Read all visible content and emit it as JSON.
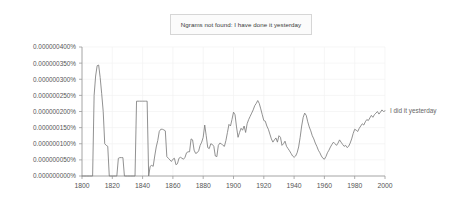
{
  "notice": {
    "text": "Ngrams not found: I have done it yesterday"
  },
  "chart_data": {
    "type": "line",
    "title": "",
    "xlabel": "",
    "ylabel": "",
    "xlim": [
      1800,
      2000
    ],
    "ylim": [
      0,
      4e-09
    ],
    "grid": true,
    "legend_position": "right-inline",
    "y_tick_labels": [
      "0.000000400%",
      "0.000000350%",
      "0.000000300%",
      "0.000000250%",
      "0.000000200%",
      "0.000000150%",
      "0.000000100%",
      "0.000000050%",
      "0.000000000%"
    ],
    "y_tick_values": [
      4e-09,
      3.5e-09,
      3e-09,
      2.5e-09,
      2e-09,
      1.5e-09,
      1e-09,
      5e-10,
      0.0
    ],
    "x_tick_labels": [
      "1800",
      "1820",
      "1840",
      "1860",
      "1880",
      "1900",
      "1920",
      "1940",
      "1960",
      "1980",
      "2000"
    ],
    "x_tick_values": [
      1800,
      1820,
      1840,
      1860,
      1880,
      1900,
      1920,
      1940,
      1960,
      1980,
      2000
    ],
    "series": [
      {
        "name": "I did it yesterday",
        "color": "#7d7d7d",
        "x": [
          1800,
          1801,
          1802,
          1803,
          1804,
          1805,
          1806,
          1807,
          1808,
          1809,
          1810,
          1811,
          1812,
          1813,
          1814,
          1815,
          1816,
          1817,
          1818,
          1819,
          1820,
          1821,
          1822,
          1823,
          1824,
          1825,
          1826,
          1827,
          1828,
          1829,
          1830,
          1831,
          1832,
          1833,
          1834,
          1835,
          1836,
          1837,
          1838,
          1839,
          1840,
          1841,
          1842,
          1843,
          1844,
          1845,
          1846,
          1847,
          1848,
          1849,
          1850,
          1851,
          1852,
          1853,
          1854,
          1855,
          1856,
          1857,
          1858,
          1859,
          1860,
          1861,
          1862,
          1863,
          1864,
          1865,
          1866,
          1867,
          1868,
          1869,
          1870,
          1871,
          1872,
          1873,
          1874,
          1875,
          1876,
          1877,
          1878,
          1879,
          1880,
          1881,
          1882,
          1883,
          1884,
          1885,
          1886,
          1887,
          1888,
          1889,
          1890,
          1891,
          1892,
          1893,
          1894,
          1895,
          1896,
          1897,
          1898,
          1899,
          1900,
          1901,
          1902,
          1903,
          1904,
          1905,
          1906,
          1907,
          1908,
          1909,
          1910,
          1911,
          1912,
          1913,
          1914,
          1915,
          1916,
          1917,
          1918,
          1919,
          1920,
          1921,
          1922,
          1923,
          1924,
          1925,
          1926,
          1927,
          1928,
          1929,
          1930,
          1931,
          1932,
          1933,
          1934,
          1935,
          1936,
          1937,
          1938,
          1939,
          1940,
          1941,
          1942,
          1943,
          1944,
          1945,
          1946,
          1947,
          1948,
          1949,
          1950,
          1951,
          1952,
          1953,
          1954,
          1955,
          1956,
          1957,
          1958,
          1959,
          1960,
          1961,
          1962,
          1963,
          1964,
          1965,
          1966,
          1967,
          1968,
          1969,
          1970,
          1971,
          1972,
          1973,
          1974,
          1975,
          1976,
          1977,
          1978,
          1979,
          1980,
          1981,
          1982,
          1983,
          1984,
          1985,
          1986,
          1987,
          1988,
          1989,
          1990,
          1991,
          1992,
          1993,
          1994,
          1995,
          1996,
          1997,
          1998,
          1999,
          2000
        ],
        "y": [
          0.0,
          0.0,
          0.0,
          0.0,
          0.0,
          0.0,
          0.0,
          0.0,
          2.5,
          3.1,
          3.42,
          3.44,
          3.05,
          2.55,
          2.0,
          1.0,
          0.95,
          0.92,
          0.0,
          0.0,
          0.0,
          0.0,
          0.0,
          0.0,
          0.55,
          0.57,
          0.57,
          0.57,
          0.0,
          0.0,
          0.0,
          0.0,
          0.0,
          0.0,
          0.0,
          0.0,
          2.32,
          2.32,
          2.32,
          2.32,
          2.32,
          2.32,
          2.32,
          2.32,
          0.0,
          0.3,
          0.33,
          0.3,
          0.62,
          0.9,
          1.1,
          1.38,
          1.45,
          1.45,
          1.43,
          1.4,
          0.6,
          0.55,
          0.5,
          0.45,
          0.52,
          0.55,
          0.35,
          0.38,
          0.55,
          0.58,
          0.55,
          0.52,
          0.58,
          0.72,
          0.75,
          0.75,
          1.15,
          1.12,
          0.8,
          0.7,
          0.72,
          0.78,
          0.95,
          1.05,
          1.2,
          1.58,
          1.25,
          0.88,
          0.85,
          1.0,
          0.98,
          0.92,
          0.62,
          0.6,
          0.95,
          1.02,
          1.0,
          0.95,
          0.92,
          1.1,
          1.35,
          1.6,
          1.55,
          1.75,
          1.98,
          1.9,
          1.52,
          1.2,
          1.35,
          1.48,
          1.42,
          1.55,
          1.35,
          1.62,
          1.75,
          1.85,
          1.95,
          2.05,
          2.18,
          2.25,
          2.34,
          2.25,
          2.08,
          1.9,
          1.72,
          1.7,
          1.55,
          1.45,
          1.3,
          1.15,
          1.05,
          1.12,
          1.18,
          1.05,
          1.25,
          1.2,
          0.95,
          1.0,
          1.08,
          0.92,
          0.85,
          0.78,
          0.7,
          0.62,
          0.58,
          0.62,
          0.72,
          0.9,
          1.2,
          1.55,
          1.82,
          1.95,
          1.88,
          1.68,
          1.52,
          1.4,
          1.25,
          1.15,
          1.02,
          0.92,
          0.8,
          0.72,
          0.62,
          0.55,
          0.52,
          0.6,
          0.72,
          0.8,
          0.9,
          0.98,
          1.05,
          1.0,
          0.95,
          1.02,
          1.12,
          1.05,
          0.98,
          0.92,
          0.95,
          0.88,
          0.92,
          1.02,
          1.15,
          1.32,
          1.45,
          1.42,
          1.38,
          1.48,
          1.55,
          1.62,
          1.58,
          1.68,
          1.75,
          1.72,
          1.8,
          1.88,
          1.82,
          1.9,
          1.95,
          2.0,
          1.92,
          1.98,
          2.05,
          2.0,
          2.02
        ],
        "y_unit_scale": 1e-09,
        "label_text": "I did it yesterday"
      }
    ]
  }
}
